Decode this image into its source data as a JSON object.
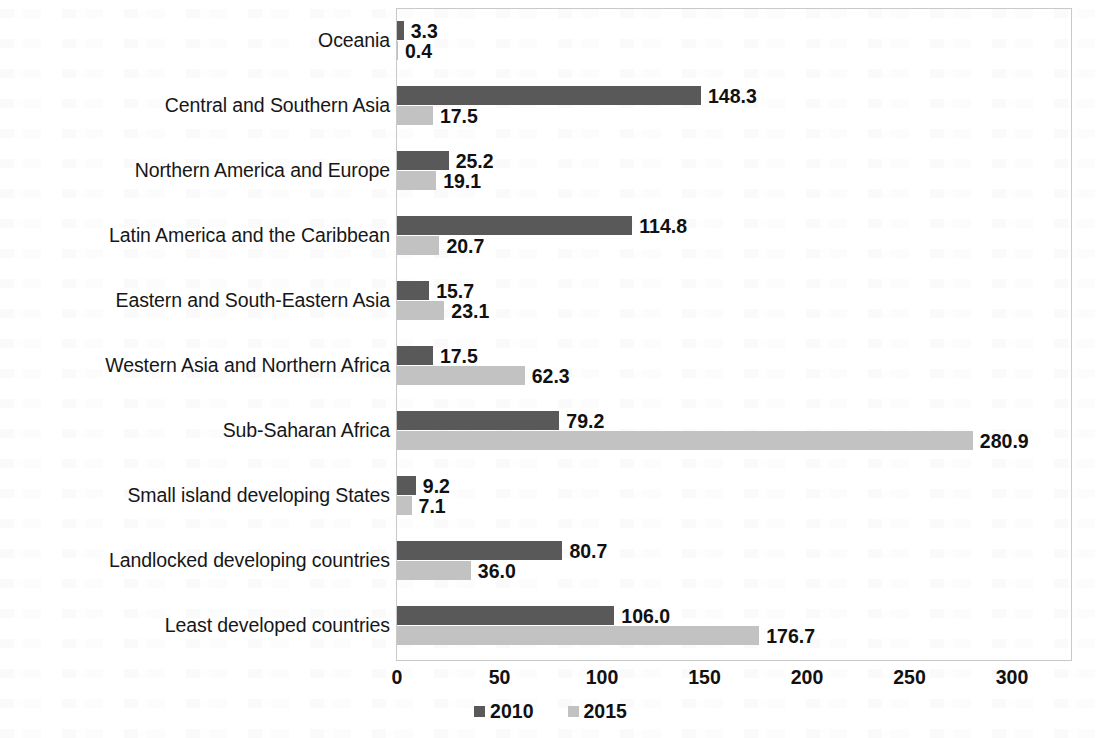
{
  "chart_data": {
    "type": "bar",
    "orientation": "horizontal",
    "title": "",
    "subtitle": "",
    "xlabel": "",
    "ylabel": "",
    "xlim": [
      0,
      300
    ],
    "xticks": [
      0,
      50,
      100,
      150,
      200,
      250,
      300
    ],
    "xtick_labels": [
      "0",
      "50",
      "100",
      "150",
      "200",
      "250",
      "300"
    ],
    "grid": false,
    "legend_position": "bottom-center",
    "categories": [
      "Oceania",
      "Central and Southern Asia",
      "Northern America and Europe",
      "Latin America and the Caribbean",
      "Eastern and South-Eastern Asia",
      "Western Asia and Northern Africa",
      "Sub-Saharan Africa",
      "Small island developing States",
      "Landlocked developing countries",
      "Least developed countries"
    ],
    "series": [
      {
        "name": "2010",
        "color": "#595959",
        "values": [
          3.3,
          148.3,
          25.2,
          114.8,
          15.7,
          17.5,
          79.2,
          9.2,
          80.7,
          106.0
        ],
        "labels": [
          "3.3",
          "148.3",
          "25.2",
          "114.8",
          "15.7",
          "17.5",
          "79.2",
          "9.2",
          "80.7",
          "106.0"
        ]
      },
      {
        "name": "2015",
        "color": "#c2c2c2",
        "values": [
          0.4,
          17.5,
          19.1,
          20.7,
          23.1,
          62.3,
          280.9,
          7.1,
          36.0,
          176.7
        ],
        "labels": [
          "0.4",
          "17.5",
          "19.1",
          "20.7",
          "23.1",
          "62.3",
          "280.9",
          "7.1",
          "36.0",
          "176.7"
        ]
      }
    ]
  },
  "legend": {
    "items": [
      {
        "label": "2010",
        "color": "#595959"
      },
      {
        "label": "2015",
        "color": "#c2c2c2"
      }
    ]
  },
  "colors": {
    "series_2010": "#595959",
    "series_2015": "#c2c2c2",
    "plot_border": "#c9c9c9",
    "text": "#111111",
    "background": "#ffffff"
  }
}
